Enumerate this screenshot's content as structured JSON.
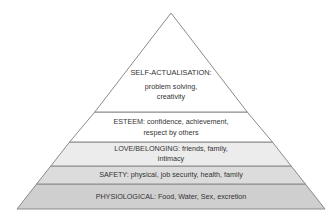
{
  "diagram": {
    "type": "pyramid",
    "levels": [
      {
        "name": "SELF-ACTUALISATION:",
        "line1": "problem solving,",
        "line2": "creativity",
        "fill": "#ffffff"
      },
      {
        "name": "ESTEEM",
        "line1": "ESTEEM: confidence, achievement,",
        "line2": "respect by others",
        "fill": "#ffffff"
      },
      {
        "name": "LOVE/BELONGING",
        "line1": "LOVE/BELONGING: friends, family,",
        "line2": "intimacy",
        "fill": "#ececec"
      },
      {
        "name": "SAFETY",
        "line1": "SAFETY: physical, job security, health, family",
        "fill": "#dcdcdc"
      },
      {
        "name": "PHYSIOLOGICAL",
        "line1": "PHYSIOLOGICAL: Food, Water, Sex, excretion",
        "fill": "#cfcfcf"
      }
    ],
    "colors": {
      "stroke": "#8a8a8a",
      "text": "#333333"
    }
  }
}
